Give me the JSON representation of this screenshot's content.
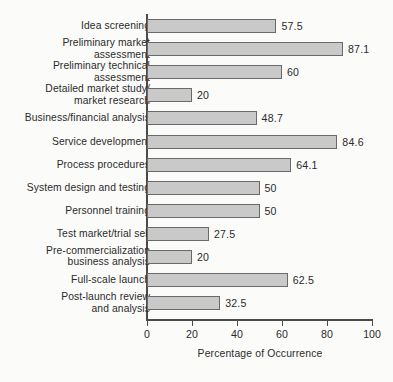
{
  "chart_data": {
    "type": "bar",
    "orientation": "horizontal",
    "title": "",
    "xlabel": "Percentage of Occurrence",
    "ylabel": "",
    "xlim": [
      0,
      100
    ],
    "xticks": [
      0,
      20,
      40,
      60,
      80,
      100
    ],
    "grid": false,
    "legend": null,
    "categories": [
      "Idea screening",
      "Preliminary market\nassessment",
      "Preliminary technical\nassessment",
      "Detailed market study/\nmarket research",
      "Business/financial analysis",
      "Service development",
      "Process procedures",
      "System design and testing",
      "Personnel training",
      "Test market/trial sell",
      "Pre-commercialization\nbusiness analysis",
      "Full-scale launch",
      "Post-launch review\nand analysis"
    ],
    "values": [
      57.5,
      87.1,
      60,
      20,
      48.7,
      84.6,
      64.1,
      50,
      50,
      27.5,
      20,
      62.5,
      32.5
    ],
    "value_labels": [
      "57.5",
      "87.1",
      "60",
      "20",
      "48.7",
      "84.6",
      "64.1",
      "50",
      "50",
      "27.5",
      "20",
      "62.5",
      "32.5"
    ],
    "colors": {
      "bar_fill": "#c9c9c9",
      "bar_border": "#6a6a6a",
      "axis": "#4b4b4b",
      "text": "#2b2b2b",
      "background": "#fbfbfa"
    }
  }
}
